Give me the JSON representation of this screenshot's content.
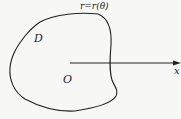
{
  "diagram": {
    "type": "polar-region",
    "curve_label": "r=r(θ)",
    "region_label": "D",
    "origin_label": "O",
    "axis_label": "x",
    "colors": {
      "stroke": "#222222",
      "background": "#f7f7f5"
    }
  }
}
